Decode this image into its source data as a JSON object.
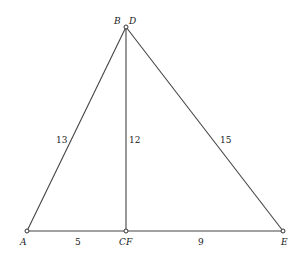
{
  "diagram": {
    "type": "geometry",
    "points": [
      {
        "id": "A",
        "label": "A",
        "x": 27,
        "y": 231
      },
      {
        "id": "BD",
        "label": "B",
        "label2": "D",
        "x": 126,
        "y": 27
      },
      {
        "id": "CF",
        "label": "CF",
        "x": 126,
        "y": 231
      },
      {
        "id": "E",
        "label": "E",
        "x": 283,
        "y": 231
      }
    ],
    "segments": [
      {
        "from": "A",
        "to": "BD",
        "length_label": "13"
      },
      {
        "from": "BD",
        "to": "CF",
        "length_label": "12"
      },
      {
        "from": "BD",
        "to": "E",
        "length_label": "15"
      },
      {
        "from": "A",
        "to": "CF",
        "length_label": "5"
      },
      {
        "from": "CF",
        "to": "E",
        "length_label": "9"
      }
    ]
  },
  "labels": {
    "A": "A",
    "B": "B",
    "D": "D",
    "CF": "CF",
    "E": "E",
    "ab": "13",
    "bc": "12",
    "de": "15",
    "ac": "5",
    "fe": "9"
  }
}
